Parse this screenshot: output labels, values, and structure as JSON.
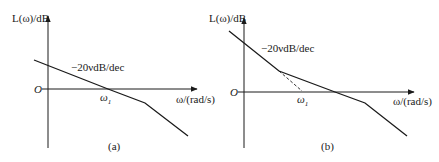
{
  "diagram": {
    "type": "bode-asymptotic-magnitude-plot",
    "panels": [
      {
        "id": "a",
        "caption": "(a)",
        "y_axis_label": "L(ω)/dB",
        "x_axis_label": "ω/(rad/s)",
        "origin_label": "O",
        "break_label": "ω",
        "break_label_sub": "1",
        "slope_label": "−20νdB/dec",
        "segments": "slope −20ν dB/dec crossing 0 dB at ω1, then steeper slope at higher frequency"
      },
      {
        "id": "b",
        "caption": "(b)",
        "y_axis_label": "L(ω)/dB",
        "x_axis_label": "ω/(rad/s)",
        "origin_label": "O",
        "break_label": "ω",
        "break_label_sub": "1",
        "slope_label": "−20νdB/dec",
        "segments": "steep initial −20ν dB/dec slope, dashed extension to ω1, flatter middle segment crossing 0 dB, then steeper high-frequency slope"
      }
    ]
  }
}
